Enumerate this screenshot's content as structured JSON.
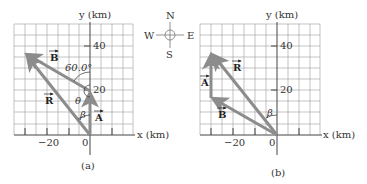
{
  "figure": {
    "panels": [
      {
        "id": "a",
        "caption": "(a)",
        "y_axis_label": "y (km)",
        "x_axis_label": "x (km)",
        "y_ticks": [
          "40",
          "20"
        ],
        "x_ticks": [
          "−20",
          "0"
        ],
        "vectors": [
          {
            "name": "A",
            "label": "A",
            "from": [
              0,
              0
            ],
            "to": [
              0,
              20
            ]
          },
          {
            "name": "B",
            "label": "B",
            "from": [
              0,
              20
            ],
            "to": [
              -30,
              37.3
            ]
          },
          {
            "name": "R",
            "label": "R",
            "from": [
              0,
              0
            ],
            "to": [
              -30,
              37.3
            ]
          }
        ],
        "angle_labels": {
          "angle_60": "60.0°",
          "theta": "θ",
          "beta": "β"
        }
      },
      {
        "id": "b",
        "caption": "(b)",
        "y_axis_label": "y (km)",
        "x_axis_label": "x (km)",
        "y_ticks": [
          "40",
          "20"
        ],
        "x_ticks": [
          "−20",
          "0"
        ],
        "vectors": [
          {
            "name": "B",
            "label": "B",
            "from": [
              0,
              0
            ],
            "to": [
              -30,
              17.3
            ]
          },
          {
            "name": "A",
            "label": "A",
            "from": [
              -30,
              17.3
            ],
            "to": [
              -30,
              37.3
            ]
          },
          {
            "name": "R",
            "label": "R",
            "from": [
              0,
              0
            ],
            "to": [
              -30,
              37.3
            ]
          }
        ],
        "angle_labels": {
          "beta": "β"
        }
      }
    ],
    "compass": {
      "north": "N",
      "south": "S",
      "west": "W",
      "east": "E"
    },
    "colors": {
      "vector": "#8c8c8c",
      "grid": "#9a9a9a",
      "axis": "#444444"
    }
  }
}
